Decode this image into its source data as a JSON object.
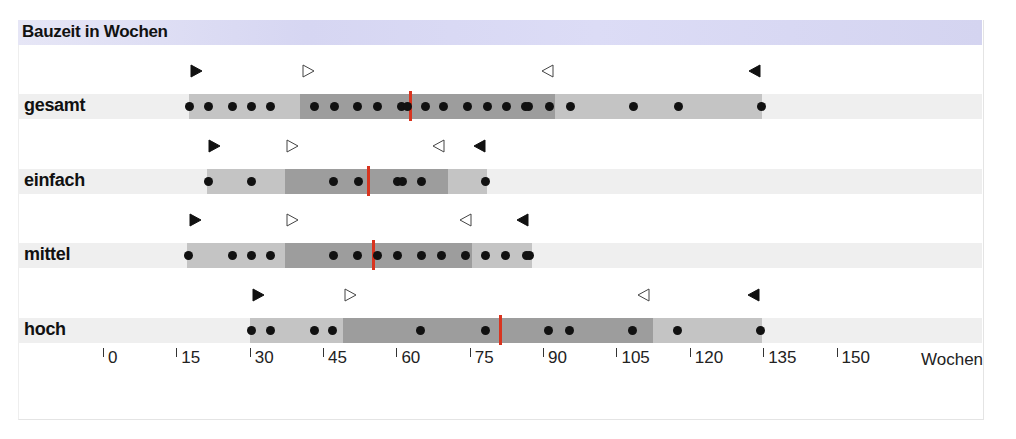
{
  "chart_data": {
    "type": "dot-range",
    "title": "Bauzeit in Wochen",
    "xlabel": "Wochen",
    "xlim": [
      0,
      180
    ],
    "xticks": [
      0,
      15,
      30,
      45,
      60,
      75,
      90,
      105,
      120,
      135,
      150
    ],
    "scale": {
      "x0_px": 104,
      "px_per_week": 4.89
    },
    "legend_markers": {
      "filled_right": "min",
      "open_right": "lower quartile",
      "open_left": "upper quartile",
      "filled_left": "max"
    },
    "colors": {
      "median": "#d9341f",
      "box_light": "#c4c4c4",
      "box_dark": "#9d9d9d",
      "dots": "#111111"
    },
    "series": [
      {
        "name": "gesamt",
        "min": 17.4,
        "q1": 40.1,
        "median": 62.7,
        "q3": 92.2,
        "max": 134.6,
        "markers": {
          "filled_right": 18.8,
          "open_right": 41.7,
          "open_left": 90.8,
          "filled_left": 133.1
        },
        "values": [
          17.4,
          21.3,
          26.2,
          30.1,
          34.0,
          43.1,
          47.2,
          51.9,
          56.0,
          60.9,
          62.0,
          65.7,
          69.5,
          74.4,
          78.5,
          82.4,
          86.1,
          86.9,
          91.2,
          95.3,
          108.2,
          117.4,
          134.4
        ]
      },
      {
        "name": "einfach",
        "min": 21.1,
        "q1": 37.0,
        "median": 54.0,
        "q3": 70.3,
        "max": 78.3,
        "markers": {
          "filled_right": 22.5,
          "open_right": 38.4,
          "open_left": 68.5,
          "filled_left": 76.9
        },
        "values": [
          21.3,
          30.1,
          47.0,
          52.1,
          60.1,
          61.1,
          65.0,
          78.1
        ]
      },
      {
        "name": "mittel",
        "min": 17.0,
        "q1": 37.0,
        "median": 55.1,
        "q3": 75.3,
        "max": 87.5,
        "markers": {
          "filled_right": 18.6,
          "open_right": 38.4,
          "open_left": 74.1,
          "filled_left": 85.7
        },
        "values": [
          17.2,
          26.2,
          30.1,
          34.0,
          47.0,
          51.9,
          56.0,
          60.1,
          65.0,
          69.1,
          74.0,
          78.1,
          82.2,
          86.3,
          87.1
        ]
      },
      {
        "name": "hoch",
        "min": 29.9,
        "q1": 48.9,
        "median": 81.0,
        "q3": 112.3,
        "max": 134.6,
        "markers": {
          "filled_right": 31.5,
          "open_right": 50.3,
          "open_left": 110.4,
          "filled_left": 132.9
        },
        "values": [
          30.1,
          34.0,
          43.0,
          46.8,
          64.8,
          78.1,
          91.0,
          95.1,
          108.0,
          117.2,
          134.2
        ]
      }
    ]
  }
}
